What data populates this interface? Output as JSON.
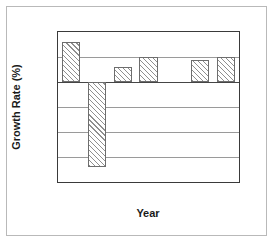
{
  "chart_data": {
    "type": "bar",
    "title": "",
    "xlabel": "Year",
    "ylabel": "Growth Rate (%)",
    "categories": [
      "1990",
      "1991",
      "1992",
      "1993",
      "1994",
      "1995",
      "1996"
    ],
    "values": [
      3.2,
      -6.8,
      1.2,
      2.0,
      null,
      1.8,
      2.0
    ],
    "series": [
      {
        "name": "Growth Rate",
        "values": [
          3.2,
          -6.8,
          1.2,
          2.0,
          null,
          1.8,
          2.0
        ]
      }
    ],
    "ylim": [
      -8,
      4
    ],
    "yticks": [
      4,
      2,
      0,
      -2,
      -4,
      -6,
      -8
    ],
    "ytick_labels": [
      "4",
      "2",
      "0",
      "-2",
      "-4",
      "-6",
      "-8"
    ],
    "minor_ytick_step": 0.5,
    "xtick_labels": [
      "1990",
      "1991",
      "1992",
      "1993",
      "1994",
      "1995",
      "1996"
    ],
    "grid": true,
    "grid_axis": "y",
    "legend": false,
    "legend_position": "none",
    "bar_fill": "diagonal-hatch",
    "annotations": [],
    "colors": {
      "bar_edge": "#6d6d6d",
      "bar_hatch": "#8f8f8f",
      "bar_face": "#ffffff",
      "gridline": "#9a9a9a",
      "zero_line": "#454545",
      "axis": "#3a3a3a",
      "text": "#1a1a1a",
      "figure_background": "#ffffff",
      "outer_frame": "#b9b9b9"
    }
  }
}
